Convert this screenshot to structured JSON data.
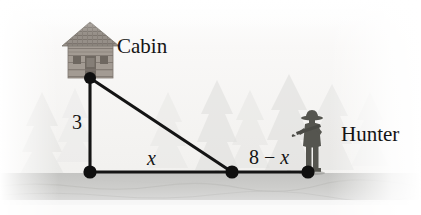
{
  "figure": {
    "width": 421,
    "height": 215,
    "labels": {
      "cabin": "Cabin",
      "hunter": "Hunter",
      "vertical_leg": "3",
      "horizontal_leg_near": "x",
      "horizontal_leg_far_prefix": "8 − ",
      "horizontal_leg_far_variable": "x"
    },
    "icons": {
      "cabin": "cabin-icon",
      "hunter": "hunter-icon",
      "trees": "pine-tree-icon",
      "vertex_dot": "vertex-dot-icon"
    },
    "colors": {
      "background": "#f7f6f4",
      "ground": "#c9c9c7",
      "line": "#1a1a1a",
      "dot": "#111111",
      "tree": "#e2e2e0",
      "cabin_wall": "#9a938c",
      "cabin_roof": "#8d867f",
      "hunter": "#4e4e4c",
      "text": "#141414"
    },
    "geometry": {
      "apex": {
        "x": 90,
        "y": 78
      },
      "base_left": {
        "x": 90,
        "y": 172
      },
      "base_mid": {
        "x": 232,
        "y": 172
      },
      "base_right": {
        "x": 308,
        "y": 172
      },
      "ground_line_y": 172,
      "ground_band_top": 173,
      "ground_band_bottom": 205,
      "vertical_leg_length": "3",
      "total_base_length": "8"
    },
    "vertices": [
      {
        "name": "cabin-vertex",
        "x": 90,
        "y": 78,
        "radius": 6
      },
      {
        "name": "base-corner-vertex",
        "x": 90,
        "y": 172,
        "radius": 6.5
      },
      {
        "name": "midpoint-vertex",
        "x": 232,
        "y": 172,
        "radius": 6.5
      },
      {
        "name": "hunter-vertex",
        "x": 308,
        "y": 172,
        "radius": 6.5
      }
    ],
    "trees": [
      {
        "x": 22,
        "y": 92,
        "w": 40,
        "h": 82,
        "opacity": 0.45
      },
      {
        "x": 58,
        "y": 86,
        "w": 34,
        "h": 74,
        "opacity": 0.35
      },
      {
        "x": 150,
        "y": 90,
        "w": 36,
        "h": 74,
        "opacity": 0.4
      },
      {
        "x": 196,
        "y": 82,
        "w": 42,
        "h": 84,
        "opacity": 0.55
      },
      {
        "x": 232,
        "y": 88,
        "w": 36,
        "h": 76,
        "opacity": 0.45
      },
      {
        "x": 266,
        "y": 76,
        "w": 46,
        "h": 92,
        "opacity": 0.55
      },
      {
        "x": 312,
        "y": 84,
        "w": 40,
        "h": 82,
        "opacity": 0.5
      },
      {
        "x": 352,
        "y": 90,
        "w": 34,
        "h": 72,
        "opacity": 0.35
      }
    ]
  }
}
